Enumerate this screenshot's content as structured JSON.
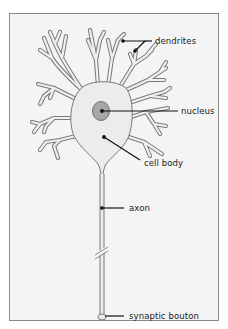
{
  "diagram": {
    "labels": {
      "dendrites": "dendrites",
      "nucleus": "nucleus",
      "cell_body": "cell body",
      "axon": "axon",
      "synaptic_bouton": "synaptic bouton"
    },
    "colors": {
      "background": "#f4f4f4",
      "cell_fill": "#ececec",
      "cell_outline": "#7a7a7a",
      "nucleus_fill": "#a6a6a6",
      "nucleus_outline": "#6e6e6e",
      "leader_line": "#111111",
      "frame_border": "#8a8a8a"
    }
  }
}
